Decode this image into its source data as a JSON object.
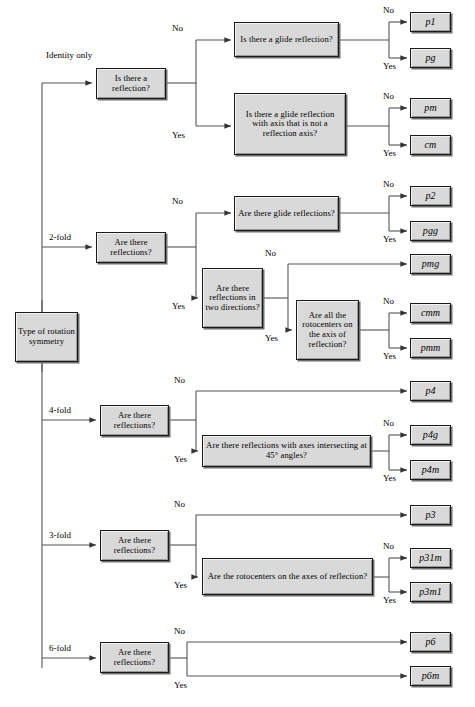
{
  "diagram": {
    "root": {
      "label": "Type of rotation symmetry"
    },
    "branch_labels": {
      "identity": "Identity only",
      "twofold": "2-fold",
      "fourfold": "4-fold",
      "threefold": "3-fold",
      "sixfold": "6-fold"
    },
    "edge_labels": {
      "yes": "Yes",
      "no": "No"
    },
    "decisions": {
      "d_refl_identity": "Is there a reflection?",
      "d_glide": "Is there a glide reflection?",
      "d_glide_axis": "Is there a glide reflection with axis that is not a reflection axis?",
      "d_refl_2fold": "Are there reflections?",
      "d_glide_refls": "Are there glide reflections?",
      "d_two_dirs": "Are there reflections in two directions?",
      "d_rotocenters_axis": "Are all the rotocenters on the axis of reflection?",
      "d_refl_4fold": "Are there reflections?",
      "d_45deg": "Are there reflections with axes intersecting at 45° angles?",
      "d_refl_3fold": "Are there reflections?",
      "d_rotocenters_axes": "Are the rotocenters on the axes of reflection?",
      "d_refl_6fold": "Are there reflections?"
    },
    "terminals": {
      "p1": "p1",
      "pg": "pg",
      "pm": "pm",
      "cm": "cm",
      "p2": "p2",
      "pgg": "pgg",
      "pmg": "pmg",
      "cmm": "cmm",
      "pmm": "pmm",
      "p4": "p4",
      "p4g": "p4g",
      "p4m": "p4m",
      "p3": "p3",
      "p31m": "p31m",
      "p3m1": "p3m1",
      "p6": "p6",
      "p6m": "p6m"
    },
    "colors": {
      "box_fill": "#d9d9d9",
      "box_border": "#1a1a1a",
      "line": "#4a4a4a"
    }
  }
}
